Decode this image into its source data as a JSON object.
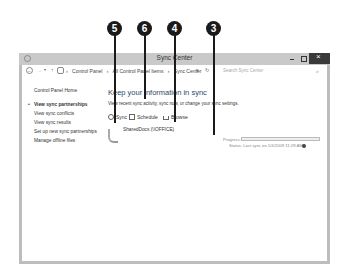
{
  "window": {
    "title": "Sync Center",
    "controls": {
      "minimize": "minimize",
      "maximize": "maximize",
      "close": "close"
    }
  },
  "addressbar": {
    "back": "←",
    "forward": "→",
    "dropdown": "▾",
    "up": "↑",
    "breadcrumb": [
      "Control Panel",
      "›",
      "All Control Panel Items",
      "›",
      "Sync Center"
    ],
    "breadcrumb_lead": "›",
    "refresh": "↻",
    "addr_dropdown": "▾",
    "search_placeholder": "Search Sync Center",
    "search_icon": "⌕"
  },
  "sidebar": {
    "home": "Control Panel Home",
    "items": [
      {
        "label": "View sync partnerships",
        "active": true
      },
      {
        "label": "View sync conflicts",
        "active": false
      },
      {
        "label": "View sync results",
        "active": false
      },
      {
        "label": "Set up new sync partnerships",
        "active": false
      },
      {
        "label": "Manage offline files",
        "active": false
      }
    ],
    "bullet": "•"
  },
  "main": {
    "heading": "Keep your information in sync",
    "subtext": "View recent sync activity, sync now, or change your sync settings.",
    "toolbar": {
      "sync": "Sync",
      "schedule": "Schedule",
      "browse": "Browse"
    },
    "partnership": {
      "name": "SharedDocs (\\\\OFFICE)",
      "progress_label": "Progress:",
      "status_label": "Status:  Last sync on 1/4/2009 11:28 AM"
    }
  },
  "callouts": [
    {
      "number": "5",
      "target": "sync-button"
    },
    {
      "number": "6",
      "target": "schedule-button"
    },
    {
      "number": "4",
      "target": "browse-button"
    },
    {
      "number": "3",
      "target": "progress-bar"
    }
  ]
}
